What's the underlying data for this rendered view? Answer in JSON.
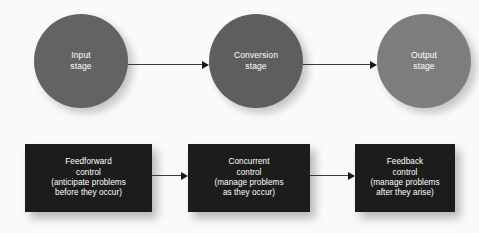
{
  "diagram": {
    "background_color": "#fafafa",
    "stages": [
      {
        "id": "input",
        "line1": "Input",
        "line2": "stage",
        "color": "#636363"
      },
      {
        "id": "conversion",
        "line1": "Conversion",
        "line2": "stage",
        "color": "#5e5e5e"
      },
      {
        "id": "output",
        "line1": "Output",
        "line2": "stage",
        "color": "#7d7d7d"
      }
    ],
    "controls": [
      {
        "id": "feedforward",
        "line1": "Feedforward",
        "line2": "control",
        "line3": "(anticipate problems",
        "line4": "before they occur)",
        "color": "#1c1c1c"
      },
      {
        "id": "concurrent",
        "line1": "Concurrent",
        "line2": "control",
        "line3": "(manage problems",
        "line4": "as they occur)",
        "color": "#1c1c1c"
      },
      {
        "id": "feedback",
        "line1": "Feedback",
        "line2": "control",
        "line3": "(manage problems",
        "line4": "after they arise)",
        "color": "#1c1c1c"
      }
    ],
    "arrows": [
      {
        "id": "input-to-conversion",
        "icon": "arrow-right-icon"
      },
      {
        "id": "conversion-to-output",
        "icon": "arrow-right-icon"
      },
      {
        "id": "feedforward-to-concurrent",
        "icon": "arrow-right-icon"
      },
      {
        "id": "concurrent-to-feedback",
        "icon": "arrow-right-icon"
      }
    ]
  }
}
